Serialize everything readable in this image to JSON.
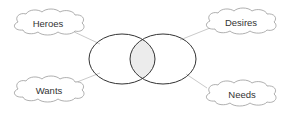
{
  "diagram": {
    "type": "venn-with-callouts",
    "colors": {
      "ellipse_stroke": "#333333",
      "overlap_fill": "#ececec",
      "cloud_stroke": "#9a9a9a",
      "connector": "#bbbbbb",
      "text": "#333333"
    },
    "clouds": [
      {
        "id": "heroes",
        "label": "Heroes",
        "position": "top-left"
      },
      {
        "id": "desires",
        "label": "Desires",
        "position": "top-right"
      },
      {
        "id": "wants",
        "label": "Wants",
        "position": "bottom-left"
      },
      {
        "id": "needs",
        "label": "Needs",
        "position": "bottom-right"
      }
    ],
    "venn": {
      "circles": 2,
      "overlap_shaded": true
    }
  }
}
